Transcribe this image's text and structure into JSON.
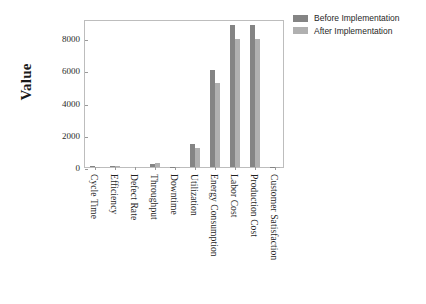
{
  "chart_data": {
    "type": "bar",
    "title": "",
    "xlabel": "",
    "ylabel": "Value",
    "ylim": [
      0,
      9200
    ],
    "yticks": [
      0,
      2000,
      4000,
      6000,
      8000
    ],
    "ytick_labels": [
      "0",
      "2000",
      "4000",
      "6000",
      "8000"
    ],
    "grid": false,
    "legend_position": "upper right outside",
    "categories": [
      "Cycle Time",
      "Efficiency",
      "Defect Rate",
      "Throughput",
      "Downtime",
      "Utilization",
      "Energy Consumption",
      "Labor Cost",
      "Production Cost",
      "Customer Satisfaction"
    ],
    "series": [
      {
        "name": "Before Implementation",
        "color": "#848484",
        "values": [
          45,
          78,
          3.2,
          210,
          12,
          1400,
          6050,
          8850,
          8850,
          7.8
        ]
      },
      {
        "name": "After Implementation",
        "color": "#b0b0b0",
        "values": [
          32,
          88,
          1.5,
          235,
          6,
          1180,
          5250,
          7950,
          7950,
          9.1
        ]
      }
    ]
  },
  "legend": {
    "items": [
      {
        "label": "Before Implementation",
        "color": "#848484"
      },
      {
        "label": "After Implementation",
        "color": "#b0b0b0"
      }
    ]
  },
  "axes": {
    "y_title": "Value"
  },
  "colors": {
    "before": "#848484",
    "after": "#b0b0b0",
    "frame": "#bdbdbd",
    "tick": "#9a9a9a",
    "text": "#1f1f1f",
    "background": "#ffffff"
  }
}
